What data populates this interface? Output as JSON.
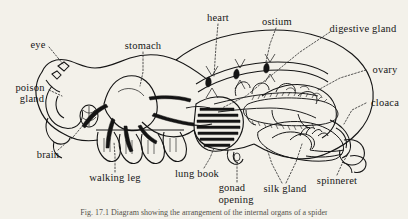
{
  "figure": {
    "caption": "Fig. 17.1  Diagram showing the arrangement of the internal organs of a spider",
    "background_color": "#f3f1ea",
    "ink_color": "#151515",
    "style": "black-and-white line drawing with dotted leader lines"
  },
  "labels": [
    {
      "id": "eye",
      "text": "eye",
      "x": 38,
      "y": 45,
      "align": "center"
    },
    {
      "id": "stomach",
      "text": "stomach",
      "x": 143,
      "y": 46,
      "align": "center"
    },
    {
      "id": "heart",
      "text": "heart",
      "x": 218,
      "y": 18,
      "align": "center"
    },
    {
      "id": "ostium",
      "text": "ostium",
      "x": 277,
      "y": 22,
      "align": "center"
    },
    {
      "id": "digestive-gland",
      "text": "digestive gland",
      "x": 363,
      "y": 29,
      "align": "center"
    },
    {
      "id": "ovary",
      "text": "ovary",
      "x": 385,
      "y": 70,
      "align": "center"
    },
    {
      "id": "cloaca",
      "text": "cloaca",
      "x": 385,
      "y": 103,
      "align": "center"
    },
    {
      "id": "poison-gland",
      "text": "poison",
      "x": 30,
      "y": 88,
      "align": "center",
      "text2": "gland"
    },
    {
      "id": "brain",
      "text": "brain",
      "x": 48,
      "y": 155,
      "align": "center"
    },
    {
      "id": "walking-leg",
      "text": "walking leg",
      "x": 115,
      "y": 178,
      "align": "center"
    },
    {
      "id": "lung-book",
      "text": "lung book",
      "x": 197,
      "y": 174,
      "align": "center"
    },
    {
      "id": "gonad-opening",
      "text": "gonad",
      "x": 232,
      "y": 188,
      "align": "center",
      "text2": "opening"
    },
    {
      "id": "silk-gland",
      "text": "silk gland",
      "x": 285,
      "y": 189,
      "align": "center"
    },
    {
      "id": "spinneret",
      "text": "spinneret",
      "x": 337,
      "y": 181,
      "align": "center"
    }
  ]
}
